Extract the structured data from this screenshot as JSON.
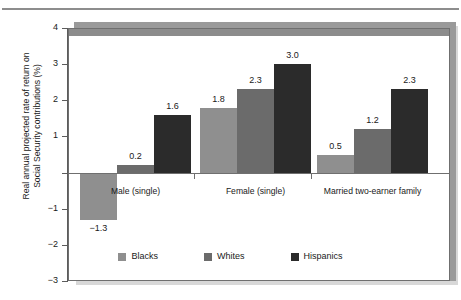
{
  "chart_data": {
    "type": "bar",
    "title": "",
    "subtitle": "",
    "xlabel": "",
    "ylabel_line1": "Real annual projected rate of return on",
    "ylabel_line2": "Social Security contributions (%)",
    "categories": [
      "Male (single)",
      "Female (single)",
      "Married two-earner family"
    ],
    "series": [
      {
        "name": "Blacks",
        "color": "#8f8f8f",
        "values": [
          -1.3,
          1.8,
          0.5
        ],
        "labels": [
          "−1.3",
          "1.8",
          "0.5"
        ]
      },
      {
        "name": "Whites",
        "color": "#6b6b6b",
        "values": [
          0.2,
          2.3,
          1.2
        ],
        "labels": [
          "0.2",
          "2.3",
          "1.2"
        ]
      },
      {
        "name": "Hispanics",
        "color": "#2b2b2b",
        "values": [
          1.6,
          3.0,
          2.3
        ],
        "labels": [
          "1.6",
          "3.0",
          "2.3"
        ]
      }
    ],
    "ylim": [
      -3,
      4
    ],
    "yticks": [
      4,
      3,
      2,
      1,
      0,
      -1,
      -2,
      -3
    ],
    "ytick_labels": [
      "4",
      "3",
      "2",
      "1",
      "",
      "−1",
      "−2",
      "−3"
    ],
    "grid": false,
    "legend_position": "bottom-center",
    "zero_line": true,
    "panel_top_band_color": "#8c8c8c"
  },
  "legend": {
    "items": [
      {
        "label": "Blacks"
      },
      {
        "label": "Whites"
      },
      {
        "label": "Hispanics"
      }
    ]
  }
}
